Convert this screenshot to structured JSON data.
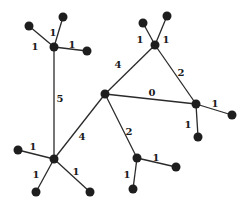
{
  "diagram": {
    "type": "weighted-tree",
    "colors": {
      "node": "#1e1e1e",
      "edge": "#2a2a2a",
      "label": "#1a1a1a",
      "background": "#ffffff"
    },
    "nodes": [
      {
        "id": "A",
        "x": 105,
        "y": 94,
        "r": 4.5
      },
      {
        "id": "B",
        "x": 54,
        "y": 47,
        "r": 4.5
      },
      {
        "id": "C",
        "x": 54,
        "y": 159,
        "r": 4.5
      },
      {
        "id": "D",
        "x": 155,
        "y": 45,
        "r": 4.5
      },
      {
        "id": "E",
        "x": 196,
        "y": 104,
        "r": 4.5
      },
      {
        "id": "F",
        "x": 137,
        "y": 158,
        "r": 4.5
      },
      {
        "id": "B1",
        "x": 29,
        "y": 26,
        "r": 4.5
      },
      {
        "id": "B2",
        "x": 63,
        "y": 17,
        "r": 4.5
      },
      {
        "id": "B3",
        "x": 87,
        "y": 51,
        "r": 4.5
      },
      {
        "id": "C1",
        "x": 18,
        "y": 150,
        "r": 4.5
      },
      {
        "id": "C2",
        "x": 36,
        "y": 192,
        "r": 4.5
      },
      {
        "id": "C3",
        "x": 90,
        "y": 192,
        "r": 4.5
      },
      {
        "id": "D1",
        "x": 143,
        "y": 23,
        "r": 4.5
      },
      {
        "id": "D2",
        "x": 167,
        "y": 16,
        "r": 4.5
      },
      {
        "id": "E1",
        "x": 232,
        "y": 115,
        "r": 4.5
      },
      {
        "id": "E2",
        "x": 198,
        "y": 137,
        "r": 4.5
      },
      {
        "id": "F1",
        "x": 176,
        "y": 167,
        "r": 4.5
      },
      {
        "id": "F2",
        "x": 133,
        "y": 189,
        "r": 4.5
      }
    ],
    "edges": [
      {
        "from": "A",
        "to": "D",
        "weight": "4",
        "lx": 118,
        "ly": 65
      },
      {
        "from": "D",
        "to": "E",
        "weight": "2",
        "lx": 181,
        "ly": 73
      },
      {
        "from": "A",
        "to": "E",
        "weight": "0",
        "lx": 152,
        "ly": 93
      },
      {
        "from": "A",
        "to": "C",
        "weight": "4",
        "lx": 82,
        "ly": 137
      },
      {
        "from": "A",
        "to": "F",
        "weight": "2",
        "lx": 129,
        "ly": 132
      },
      {
        "from": "B",
        "to": "C",
        "weight": "5",
        "lx": 60,
        "ly": 99
      },
      {
        "from": "B",
        "to": "B1",
        "weight": "1",
        "lx": 35,
        "ly": 47
      },
      {
        "from": "B",
        "to": "B2",
        "weight": "1",
        "lx": 53,
        "ly": 33
      },
      {
        "from": "B",
        "to": "B3",
        "weight": "1",
        "lx": 72,
        "ly": 45
      },
      {
        "from": "C",
        "to": "C1",
        "weight": "1",
        "lx": 33,
        "ly": 147
      },
      {
        "from": "C",
        "to": "C2",
        "weight": "1",
        "lx": 36,
        "ly": 175
      },
      {
        "from": "C",
        "to": "C3",
        "weight": "1",
        "lx": 76,
        "ly": 172
      },
      {
        "from": "D",
        "to": "D1",
        "weight": "1",
        "lx": 140,
        "ly": 40
      },
      {
        "from": "D",
        "to": "D2",
        "weight": "1",
        "lx": 166,
        "ly": 40
      },
      {
        "from": "E",
        "to": "E1",
        "weight": "1",
        "lx": 215,
        "ly": 104
      },
      {
        "from": "E",
        "to": "E2",
        "weight": "1",
        "lx": 188,
        "ly": 125
      },
      {
        "from": "F",
        "to": "F1",
        "weight": "1",
        "lx": 156,
        "ly": 158
      },
      {
        "from": "F",
        "to": "F2",
        "weight": "1",
        "lx": 127,
        "ly": 175
      }
    ]
  }
}
